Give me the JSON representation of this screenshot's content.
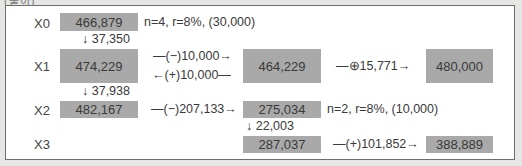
{
  "header": {
    "text": "(풀이)"
  },
  "rows": {
    "x0": {
      "label": "X0",
      "value": "466,879",
      "note": "n=4, r=8%, (30,000)"
    },
    "x1": {
      "label": "X1",
      "value": "474,229",
      "middle_value": "464,229",
      "right_value": "480,000"
    },
    "x2": {
      "label": "X2",
      "value": "482,167",
      "middle_value": "275,034",
      "note": "n=2, r=8%, (10,000)"
    },
    "x3": {
      "label": "X3",
      "middle_value": "287,037",
      "right_value": "388,889"
    }
  },
  "arrows": {
    "x0_to_x1": "↓ 37,350",
    "x1_to_x2": "↓ 37,938",
    "x2mid_to_x3mid": "↓ 22,003",
    "x1_forward": "—(−)10,000→",
    "x1_backward": "←(+)10,000—",
    "x1_mid_to_right": "—⊕15,771→",
    "x2_left_to_mid": "—(−)207,133→",
    "x3_mid_to_right": "—(+)101,852→"
  },
  "colors": {
    "box_fill": "#a9a9a9",
    "frame_border": "#6e6e6e",
    "background": "#e6e6e4"
  }
}
